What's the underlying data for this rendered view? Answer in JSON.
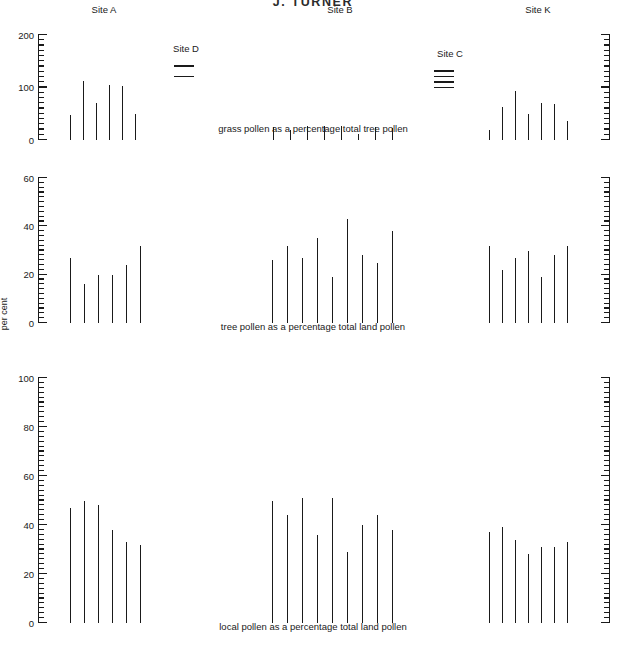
{
  "header": {
    "title": "J. TURNER"
  },
  "axis_label": "per cent",
  "site_labels": {
    "a": "Site A",
    "b": "Site B",
    "c": "Site C",
    "d": "Site D",
    "k": "Site K"
  },
  "chart_data": [
    {
      "type": "bar",
      "title": "grass pollen as a percentage total tree pollen",
      "xlabel": "",
      "ylabel": "",
      "ylim": [
        0,
        200
      ],
      "ticks_major": [
        0,
        100,
        200
      ],
      "tick_labels": [
        "0",
        "100",
        "200"
      ],
      "tick_minor_step": 10,
      "grid": false,
      "legend": "none",
      "series": [
        {
          "name": "Site A",
          "values": [
            48,
            113,
            70,
            105,
            102,
            50
          ]
        },
        {
          "name": "Site D",
          "values": [],
          "marker": "dashes",
          "dash_count": 2
        },
        {
          "name": "Site B",
          "values": [
            25,
            20,
            26,
            26,
            27,
            12,
            25,
            22
          ]
        },
        {
          "name": "Site C",
          "values": [],
          "marker": "dashes",
          "dash_count": 4
        },
        {
          "name": "Site K",
          "values": [
            20,
            62,
            94,
            50,
            70,
            68,
            37
          ]
        }
      ]
    },
    {
      "type": "bar",
      "title": "tree pollen as a percentage total land pollen",
      "xlabel": "",
      "ylabel": "per cent",
      "ylim": [
        0,
        60
      ],
      "ticks_major": [
        0,
        20,
        40,
        60
      ],
      "tick_labels": [
        "0",
        "20",
        "40",
        "60"
      ],
      "tick_minor_step": 2,
      "grid": false,
      "legend": "none",
      "series": [
        {
          "name": "Site A",
          "values": [
            27,
            16,
            20,
            20,
            24,
            32
          ]
        },
        {
          "name": "Site B",
          "values": [
            26,
            32,
            27,
            35,
            19,
            43,
            28,
            25,
            38
          ]
        },
        {
          "name": "Site K",
          "values": [
            32,
            22,
            27,
            30,
            19,
            28,
            32
          ]
        }
      ]
    },
    {
      "type": "bar",
      "title": "local pollen as a percentage total land pollen",
      "xlabel": "",
      "ylabel": "",
      "ylim": [
        0,
        100
      ],
      "ticks_major": [
        0,
        20,
        40,
        60,
        80,
        100
      ],
      "tick_labels": [
        "0",
        "20",
        "40",
        "60",
        "80",
        "100"
      ],
      "tick_minor_step": 2,
      "grid": false,
      "legend": "none",
      "series": [
        {
          "name": "Site A",
          "values": [
            47,
            50,
            48,
            38,
            33,
            32
          ]
        },
        {
          "name": "Site B",
          "values": [
            50,
            44,
            51,
            36,
            51,
            29,
            40,
            44,
            38
          ]
        },
        {
          "name": "Site K",
          "values": [
            37,
            39,
            34,
            28,
            31,
            31,
            33
          ]
        }
      ]
    }
  ]
}
